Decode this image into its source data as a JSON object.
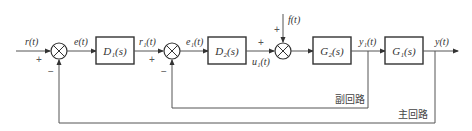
{
  "signals": {
    "input": "r(t)",
    "error": "e(t)",
    "r1": "r₁(t)",
    "e1": "e₁(t)",
    "u1": "u₁(t)",
    "disturbance": "f(t)",
    "y1": "y₁(t)",
    "output": "y(t)"
  },
  "blocks": {
    "d1": "D₁(s)",
    "d2": "D₂(s)",
    "g2": "G₂(s)",
    "g1": "G₁(s)"
  },
  "signs": {
    "sum1_input": "+",
    "sum1_feedback": "−",
    "sum2_input": "+",
    "sum2_feedback": "−",
    "sum3_input": "+",
    "sum3_disturbance": "+"
  },
  "loops": {
    "inner": "副回路",
    "outer": "主回路"
  },
  "colors": {
    "line": "#555555",
    "box": "#333333",
    "text": "#333333"
  }
}
